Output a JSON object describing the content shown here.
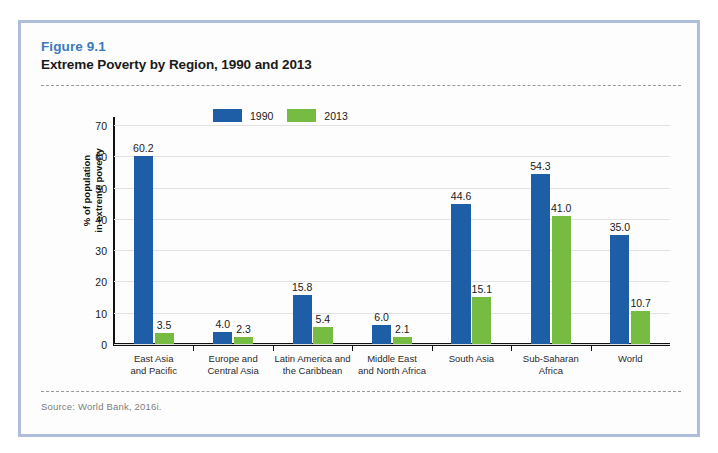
{
  "figure": {
    "number": "Figure 9.1",
    "title": "Extreme Poverty by Region, 1990 and 2013",
    "source": "Source: World Bank, 2016i."
  },
  "colors": {
    "series_1990": "#1d5ea6",
    "series_2013": "#76bc43",
    "figure_number": "#3c79bd",
    "frame_border": "#aebdd9"
  },
  "legend": {
    "items": [
      {
        "label": "1990",
        "color": "#1d5ea6",
        "swatch": "legend-swatch-1990"
      },
      {
        "label": "2013",
        "color": "#76bc43",
        "swatch": "legend-swatch-2013"
      }
    ]
  },
  "axis": {
    "y_title_line1": "% of population",
    "y_title_line2": "in extreme poverty",
    "y_ticks": [
      "0",
      "10",
      "20",
      "30",
      "40",
      "50",
      "60",
      "70"
    ]
  },
  "chart_data": {
    "type": "bar",
    "title": "Extreme Poverty by Region, 1990 and 2013",
    "xlabel": "",
    "ylabel": "% of population in extreme poverty",
    "ylim": [
      0,
      70
    ],
    "ytick_step": 10,
    "grid": true,
    "legend_position": "top-center",
    "categories": [
      "East Asia and Pacific",
      "Europe and Central Asia",
      "Latin America and the Caribbean",
      "Middle East and North Africa",
      "South Asia",
      "Sub-Saharan Africa",
      "World"
    ],
    "category_lines": [
      [
        "East Asia",
        "and Pacific"
      ],
      [
        "Europe and",
        "Central Asia"
      ],
      [
        "Latin America and",
        "the Caribbean"
      ],
      [
        "Middle East",
        "and North Africa"
      ],
      [
        "South Asia",
        ""
      ],
      [
        "Sub-Saharan",
        "Africa"
      ],
      [
        "World",
        ""
      ]
    ],
    "series": [
      {
        "name": "1990",
        "color": "#1d5ea6",
        "values": [
          60.2,
          4.0,
          15.8,
          6.0,
          44.6,
          54.3,
          35.0
        ],
        "labels": [
          "60.2",
          "4.0",
          "15.8",
          "6.0",
          "44.6",
          "54.3",
          "35.0"
        ]
      },
      {
        "name": "2013",
        "color": "#76bc43",
        "values": [
          3.5,
          2.3,
          5.4,
          2.1,
          15.1,
          41.0,
          10.7
        ],
        "labels": [
          "3.5",
          "2.3",
          "5.4",
          "2.1",
          "15.1",
          "41.0",
          "10.7"
        ]
      }
    ]
  }
}
